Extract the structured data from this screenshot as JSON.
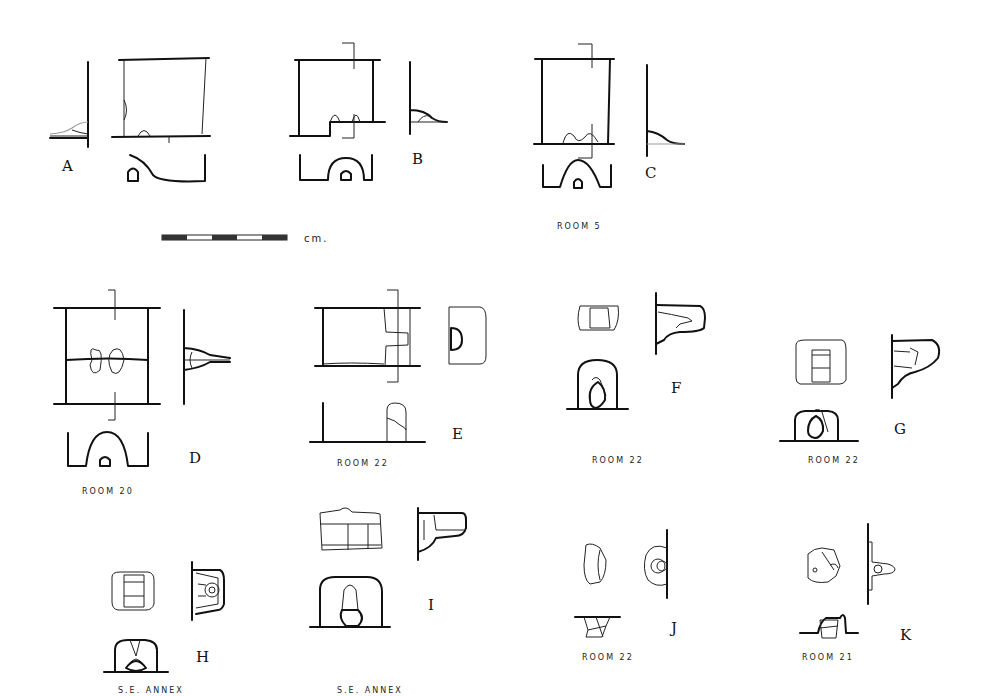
{
  "figure": {
    "type": "archaeological line drawings of fixtures (plan, section and elevation views)",
    "scale_bar": {
      "unit_label": "cm.",
      "segments": 3
    },
    "items": [
      {
        "label": "A",
        "caption": ""
      },
      {
        "label": "B",
        "caption": ""
      },
      {
        "label": "C",
        "caption": "ROOM 5"
      },
      {
        "label": "D",
        "caption": "ROOM 20"
      },
      {
        "label": "E",
        "caption": "ROOM 22"
      },
      {
        "label": "F",
        "caption": "ROOM 22"
      },
      {
        "label": "G",
        "caption": "ROOM 22"
      },
      {
        "label": "H",
        "caption": "S.E. ANNEX"
      },
      {
        "label": "I",
        "caption": "S.E. ANNEX"
      },
      {
        "label": "J",
        "caption": "ROOM 22"
      },
      {
        "label": "K",
        "caption": "ROOM 21"
      }
    ]
  }
}
